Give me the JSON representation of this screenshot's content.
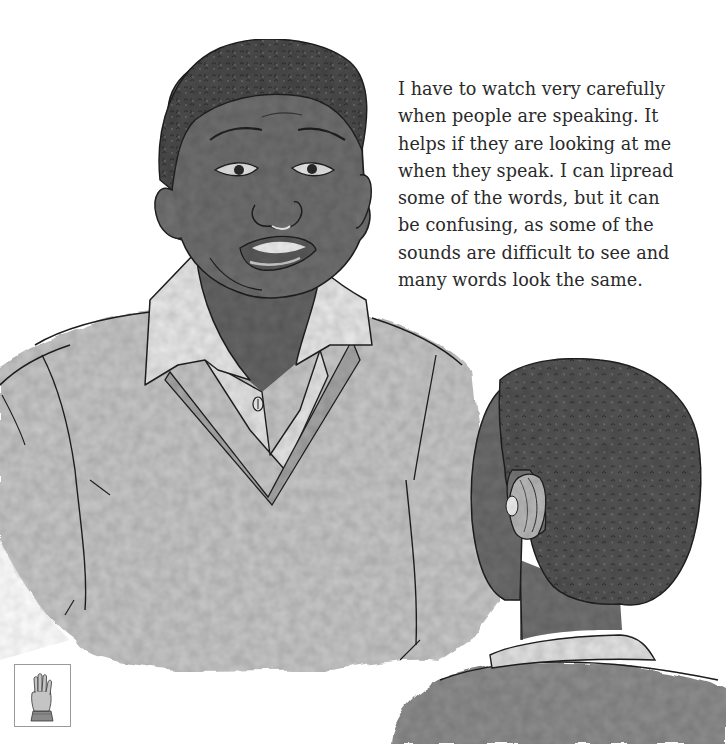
{
  "page": {
    "type": "picture-book page",
    "text_lines": [
      "I have to watch very carefully",
      "when people are speaking. It",
      "helps if they are looking at me",
      "when they speak. I can lipread",
      "some of the words, but it can",
      "be confusing, as some of the",
      "sounds are difficult to see and",
      "many words look the same."
    ]
  },
  "illustration": {
    "description": "Greyscale watercolour of a smiling boy in a collared shirt and V-neck sweater speaking, with the back of another boy's head wearing a behind-the-ear hearing aid in the foreground",
    "palette": {
      "background": "#ffffff",
      "skin": "#6f6f6f",
      "skin_dark": "#5a5a5a",
      "hair": "#4a4a4a",
      "sweater": "#c9c9c9",
      "sweater_trim": "#a8a8a8",
      "shirt": "#e9e9e9",
      "ink": "#222222"
    }
  },
  "sign_icon": {
    "name": "raised-hand-sign-icon",
    "border_color": "#9a9a9a"
  }
}
